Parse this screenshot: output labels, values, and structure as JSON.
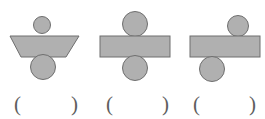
{
  "page": {
    "background_color": "#ffffff",
    "width": 265,
    "height": 119
  },
  "style": {
    "shape_fill": "#b0b0b0",
    "shape_stroke": "#6e6e6e",
    "paren_color": "#5e5e5e"
  },
  "figures": [
    {
      "id": "figure-1",
      "name": "trapezoid-with-circles",
      "body_shape": "trapezoid",
      "top_circle": {
        "diameter": 17,
        "offset": "center"
      },
      "bottom_circle": {
        "diameter": 25,
        "offset": "center"
      },
      "answer": {
        "left_paren": "(",
        "right_paren": ")",
        "value": ""
      }
    },
    {
      "id": "figure-2",
      "name": "rectangle-with-centered-circles",
      "body_shape": "rectangle",
      "top_circle": {
        "diameter": 25,
        "offset": "center"
      },
      "bottom_circle": {
        "diameter": 25,
        "offset": "center"
      },
      "answer": {
        "left_paren": "(",
        "right_paren": ")",
        "value": ""
      }
    },
    {
      "id": "figure-3",
      "name": "rectangle-with-offset-circles",
      "body_shape": "rectangle",
      "top_circle": {
        "diameter": 21,
        "offset": "right"
      },
      "bottom_circle": {
        "diameter": 25,
        "offset": "left"
      },
      "answer": {
        "left_paren": "(",
        "right_paren": ")",
        "value": ""
      }
    }
  ]
}
